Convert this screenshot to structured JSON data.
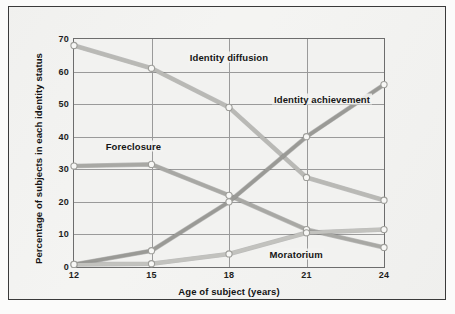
{
  "chart_data": {
    "type": "line",
    "title": "",
    "xlabel": "Age of subject (years)",
    "ylabel": "Percentage of subjects in each identity status",
    "x": [
      12,
      15,
      18,
      21,
      24
    ],
    "xtick_labels": [
      "12",
      "15",
      "18",
      "21",
      "24"
    ],
    "ytick_labels": [
      "0",
      "10",
      "20",
      "30",
      "40",
      "50",
      "60",
      "70"
    ],
    "yticks": [
      0,
      10,
      20,
      30,
      40,
      50,
      60,
      70
    ],
    "xlim": [
      12,
      24
    ],
    "ylim": [
      0,
      70
    ],
    "grid": true,
    "legend_position": "inline-labels",
    "series": [
      {
        "name": "Identity diffusion",
        "values": [
          68,
          61,
          49,
          27.5,
          20.5
        ],
        "color": "#b9b9b5",
        "label_x": 18.0,
        "label_y": 64.5
      },
      {
        "name": "Foreclosure",
        "values": [
          31,
          31.5,
          22,
          11.5,
          6
        ],
        "color": "#a8a8a4",
        "label_x": 14.3,
        "label_y": 37.0
      },
      {
        "name": "Identity achievement",
        "values": [
          0.8,
          5,
          20,
          40,
          56
        ],
        "color": "#9a9a96",
        "label_x": 21.6,
        "label_y": 51.5
      },
      {
        "name": "Moratorium",
        "values": [
          0.8,
          1,
          4,
          10.5,
          11.5
        ],
        "color": "#c2c2be",
        "label_x": 20.6,
        "label_y": 4.0
      }
    ]
  },
  "colors": {
    "frame": "#3a3a3a",
    "grid": "#9a9a9a",
    "plot_background": "#f2f2f0",
    "page_background": "#f4f4f2",
    "marker_fill": "#f7f7f5",
    "marker_stroke": "#9e9e9a",
    "text": "#141414"
  }
}
